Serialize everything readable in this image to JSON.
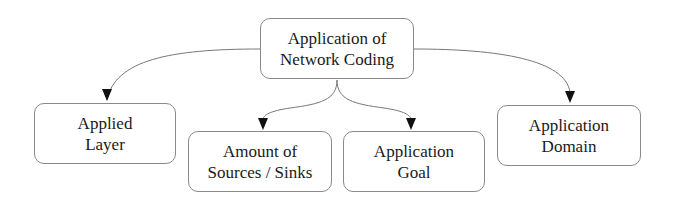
{
  "diagram": {
    "root": {
      "lines": [
        "Application of",
        "Network Coding"
      ]
    },
    "children": [
      {
        "id": "applied-layer",
        "lines": [
          "Applied",
          "Layer"
        ]
      },
      {
        "id": "amount-sources-sinks",
        "lines": [
          "Amount of",
          "Sources / Sinks"
        ]
      },
      {
        "id": "application-goal",
        "lines": [
          "Application",
          "Goal"
        ]
      },
      {
        "id": "application-domain",
        "lines": [
          "Application",
          "Domain"
        ]
      }
    ],
    "edges": [
      {
        "from": "root",
        "to": "applied-layer"
      },
      {
        "from": "root",
        "to": "amount-sources-sinks"
      },
      {
        "from": "root",
        "to": "application-goal"
      },
      {
        "from": "root",
        "to": "application-domain"
      }
    ]
  }
}
